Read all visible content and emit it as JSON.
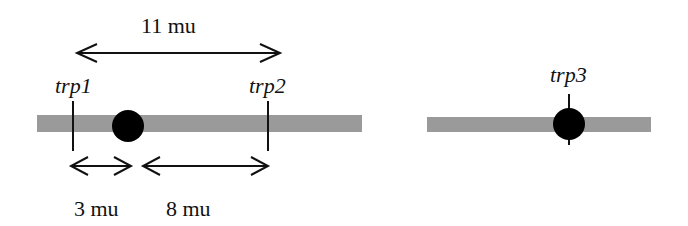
{
  "diagram": {
    "type": "genetic-linkage-map",
    "colors": {
      "chromosome": "#9a9a9a",
      "centromere": "#000000",
      "line": "#111111",
      "background": "#ffffff"
    },
    "chromosomes": [
      {
        "id": "chromosome-1",
        "genes": [
          {
            "name": "trp1"
          },
          {
            "name": "trp2"
          }
        ],
        "distances": [
          {
            "label": "11 mu",
            "from": "trp1",
            "to": "trp2"
          },
          {
            "label": "3 mu",
            "from": "trp1",
            "to": "centromere"
          },
          {
            "label": "8 mu",
            "from": "centromere",
            "to": "trp2"
          }
        ]
      },
      {
        "id": "chromosome-2",
        "genes": [
          {
            "name": "trp3"
          }
        ]
      }
    ]
  }
}
